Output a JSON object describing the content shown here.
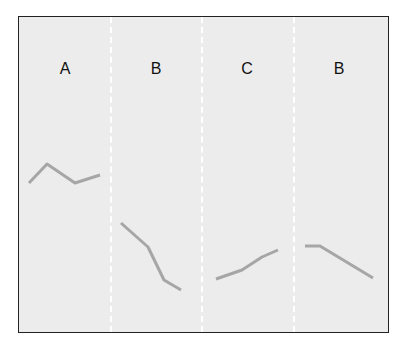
{
  "diagram": {
    "panels": [
      {
        "label": "A",
        "trend": "up-down-up",
        "points": [
          [
            29,
            183
          ],
          [
            47,
            164
          ],
          [
            75,
            183
          ],
          [
            100,
            175
          ]
        ]
      },
      {
        "label": "B",
        "trend": "decreasing",
        "points": [
          [
            121,
            223
          ],
          [
            148,
            247
          ],
          [
            164,
            280
          ],
          [
            181,
            290
          ]
        ]
      },
      {
        "label": "C",
        "trend": "increasing",
        "points": [
          [
            216,
            279
          ],
          [
            242,
            270
          ],
          [
            262,
            257
          ],
          [
            278,
            250
          ]
        ]
      },
      {
        "label": "B",
        "trend": "flat-then-decreasing",
        "points": [
          [
            305,
            246
          ],
          [
            320,
            246
          ],
          [
            373,
            278
          ]
        ]
      }
    ],
    "line_color": "#a6a6a6",
    "background_color": "#ececec"
  }
}
